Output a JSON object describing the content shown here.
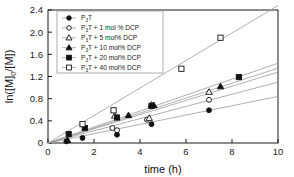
{
  "chart_data": {
    "type": "line",
    "title": "",
    "xlabel": "time (h)",
    "ylabel": "ln([M]₀/[M])",
    "ylabel_parts": {
      "pre": "ln([M]",
      "sub": "0",
      "post": "/[M])"
    },
    "xlim": [
      0,
      10
    ],
    "ylim": [
      0,
      2.4
    ],
    "xticks": [
      0,
      2,
      4,
      6,
      8,
      10
    ],
    "xticklabels": [
      "0",
      "2",
      "4",
      "6",
      "8",
      "10"
    ],
    "yticks": [
      0,
      0.4,
      0.8,
      1.2,
      1.6,
      2.0,
      2.4
    ],
    "yticklabels": [
      "0",
      "0.4",
      "0.8",
      "1.2",
      "1.6",
      "2.0",
      "2.4"
    ],
    "grid": false,
    "legend_position": "upper left",
    "series": [
      {
        "name": "P3T",
        "label_pre": "P",
        "label_sub": "3",
        "label_post": "T",
        "marker": "filled-circle",
        "color": "#1a1a1a",
        "slope": 0.084,
        "fit": [
          [
            0,
            0
          ],
          [
            10,
            0.84
          ]
        ],
        "points": [
          [
            0.8,
            0.03
          ],
          [
            1.5,
            0.09
          ],
          [
            3.0,
            0.15
          ],
          [
            4.5,
            0.34
          ],
          [
            7.0,
            0.59
          ]
        ]
      },
      {
        "name": "P3T + 1 mol % DCP",
        "label_pre": "P",
        "label_sub": "3",
        "label_post": "T + 1 mol % DCP",
        "marker": "open-circle",
        "color": "#1a1a1a",
        "slope": 0.11,
        "fit": [
          [
            0,
            0
          ],
          [
            10,
            1.1
          ]
        ],
        "points": [
          [
            2.8,
            0.27
          ],
          [
            3.0,
            0.23
          ],
          [
            4.3,
            0.42
          ],
          [
            7.0,
            0.78
          ]
        ]
      },
      {
        "name": "P3T + 5 mol% DCP",
        "label_pre": "P",
        "label_sub": "3",
        "label_post": "T + 5 mol% DCP",
        "marker": "open-triangle",
        "color": "#1a1a1a",
        "slope": 0.128,
        "fit": [
          [
            0,
            0
          ],
          [
            10,
            1.28
          ]
        ],
        "points": [
          [
            2.9,
            0.49
          ],
          [
            4.4,
            0.45
          ],
          [
            4.5,
            0.69
          ],
          [
            7.0,
            0.92
          ]
        ]
      },
      {
        "name": "P3T + 10 mol% DCP",
        "label_pre": "P",
        "label_sub": "3",
        "label_post": "T + 10 mol% DCP",
        "marker": "filled-triangle",
        "color": "#1a1a1a",
        "slope": 0.135,
        "fit": [
          [
            0,
            0
          ],
          [
            10,
            1.35
          ]
        ],
        "points": [
          [
            0.85,
            0.05
          ],
          [
            3.5,
            0.5
          ],
          [
            4.6,
            0.68
          ],
          [
            7.5,
            1.02
          ]
        ]
      },
      {
        "name": "P3T + 20 mol% DCP",
        "label_pre": "P",
        "label_sub": "3",
        "label_post": "T + 20 mol% DCP",
        "marker": "filled-square",
        "color": "#1a1a1a",
        "slope": 0.144,
        "fit": [
          [
            0,
            0
          ],
          [
            10,
            1.44
          ]
        ],
        "points": [
          [
            0.9,
            0.16
          ],
          [
            1.6,
            0.27
          ],
          [
            3.0,
            0.46
          ],
          [
            4.5,
            0.67
          ],
          [
            8.3,
            1.19
          ]
        ]
      },
      {
        "name": "P3T + 40 mol% DCP",
        "label_pre": "P",
        "label_sub": "3",
        "label_post": "T + 40 mol% DCP",
        "marker": "open-square",
        "color": "#1a1a1a",
        "slope": 0.248,
        "fit": [
          [
            0,
            0
          ],
          [
            10,
            2.48
          ]
        ],
        "points": [
          [
            1.5,
            0.34
          ],
          [
            2.85,
            0.59
          ],
          [
            5.8,
            1.34
          ],
          [
            7.5,
            1.9
          ]
        ]
      }
    ]
  },
  "colors": {
    "axis": "#1a1a1a",
    "line": "#9a9a9a",
    "marker_fill": "#111111",
    "marker_open_fill": "#ffffff",
    "legend_border": "#9a9a9a",
    "background": "#ffffff"
  }
}
